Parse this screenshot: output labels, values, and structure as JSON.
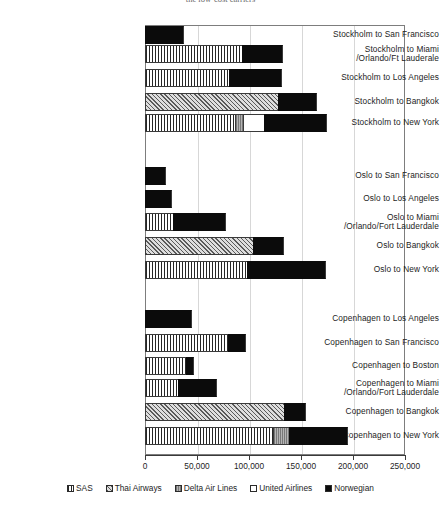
{
  "chart_data": {
    "type": "bar",
    "orientation": "horizontal",
    "stacked": true,
    "title": "the low-cost carriers",
    "xlabel": "",
    "ylabel": "",
    "xlim": [
      0,
      250000
    ],
    "xticks": [
      "0",
      "50,000",
      "100,000",
      "150,000",
      "200,000",
      "250,000"
    ],
    "xtick_values": [
      0,
      50000,
      100000,
      150000,
      200000,
      250000
    ],
    "grid": true,
    "legend_position": "bottom",
    "series": [
      {
        "name": "SAS",
        "pattern": "vertical-lines"
      },
      {
        "name": "Thai Airways",
        "pattern": "diagonal-hatch"
      },
      {
        "name": "Delta Air Lines",
        "pattern": "gray-dense"
      },
      {
        "name": "United Airlines",
        "pattern": "white"
      },
      {
        "name": "Norwegian",
        "pattern": "solid-black"
      }
    ],
    "groups": [
      {
        "name": "Stockholm",
        "rows": [
          {
            "label": [
              "Stockholm to San Francisco"
            ],
            "values": {
              "SAS": 0,
              "Thai Airways": 0,
              "Delta Air Lines": 0,
              "United Airlines": 0,
              "Norwegian": 37500
            }
          },
          {
            "label": [
              "Stockholm to Miami",
              "/Orlando/Ft Lauderale"
            ],
            "values": {
              "SAS": 93000,
              "Thai Airways": 0,
              "Delta Air Lines": 0,
              "United Airlines": 0,
              "Norwegian": 39500
            }
          },
          {
            "label": [
              "Stockholm to Los Angeles"
            ],
            "values": {
              "SAS": 81000,
              "Thai Airways": 0,
              "Delta Air Lines": 0,
              "United Airlines": 0,
              "Norwegian": 50500
            }
          },
          {
            "label": [
              "Stockholm to Bangkok"
            ],
            "values": {
              "SAS": 0,
              "Thai Airways": 128000,
              "Delta Air Lines": 0,
              "United Airlines": 0,
              "Norwegian": 37000
            }
          },
          {
            "label": [
              "Stockholm to New York"
            ],
            "values": {
              "SAS": 86500,
              "Thai Airways": 0,
              "Delta Air Lines": 7500,
              "United Airlines": 20500,
              "Norwegian": 60500
            }
          }
        ]
      },
      {
        "name": "Oslo",
        "rows": [
          {
            "label": [
              "Oslo to San Francisco"
            ],
            "values": {
              "SAS": 0,
              "Thai Airways": 0,
              "Delta Air Lines": 0,
              "United Airlines": 0,
              "Norwegian": 20000
            }
          },
          {
            "label": [
              "Oslo to Los Angeles"
            ],
            "values": {
              "SAS": 0,
              "Thai Airways": 0,
              "Delta Air Lines": 0,
              "United Airlines": 0,
              "Norwegian": 26000
            }
          },
          {
            "label": [
              "Oslo to Miami",
              "/Orlando/Fort Lauderdale"
            ],
            "values": {
              "SAS": 27000,
              "Thai Airways": 0,
              "Delta Air Lines": 0,
              "United Airlines": 0,
              "Norwegian": 51000
            }
          },
          {
            "label": [
              "Oslo to Bangkok"
            ],
            "values": {
              "SAS": 0,
              "Thai Airways": 104000,
              "Delta Air Lines": 0,
              "United Airlines": 0,
              "Norwegian": 29500
            }
          },
          {
            "label": [
              "Oslo to New York"
            ],
            "values": {
              "SAS": 98000,
              "Thai Airways": 0,
              "Delta Air Lines": 0,
              "United Airlines": 0,
              "Norwegian": 76000
            }
          }
        ]
      },
      {
        "name": "Copenhagen",
        "rows": [
          {
            "label": [
              "Copenhagen to Los Angeles"
            ],
            "values": {
              "SAS": 0,
              "Thai Airways": 0,
              "Delta Air Lines": 0,
              "United Airlines": 0,
              "Norwegian": 45000
            }
          },
          {
            "label": [
              "Copenhagen to San Francisco"
            ],
            "values": {
              "SAS": 80000,
              "Thai Airways": 0,
              "Delta Air Lines": 0,
              "United Airlines": 0,
              "Norwegian": 17000
            }
          },
          {
            "label": [
              "Copenhagen to Boston"
            ],
            "values": {
              "SAS": 39000,
              "Thai Airways": 0,
              "Delta Air Lines": 0,
              "United Airlines": 0,
              "Norwegian": 8000
            }
          },
          {
            "label": [
              "Copenhagen to Miami",
              "/Orlando/Fort Lauderdale"
            ],
            "values": {
              "SAS": 31500,
              "Thai Airways": 0,
              "Delta Air Lines": 0,
              "United Airlines": 0,
              "Norwegian": 37500
            }
          },
          {
            "label": [
              "Copenhagen to Bangkok"
            ],
            "values": {
              "SAS": 0,
              "Thai Airways": 133500,
              "Delta Air Lines": 0,
              "United Airlines": 0,
              "Norwegian": 21500
            }
          },
          {
            "label": [
              "Copenhagen to New York"
            ],
            "values": {
              "SAS": 123000,
              "Thai Airways": 0,
              "Delta Air Lines": 15500,
              "United Airlines": 0,
              "Norwegian": 56500
            }
          }
        ]
      }
    ]
  },
  "colors": {
    "axis": "#3a3a3a",
    "grid": "#d7d7d7",
    "frame": "#7d7d7d",
    "norwegian": "#0b0b0b",
    "delta": "#9a9a9a",
    "thai": "#cfcfcf",
    "text": "#1d1d1d"
  }
}
